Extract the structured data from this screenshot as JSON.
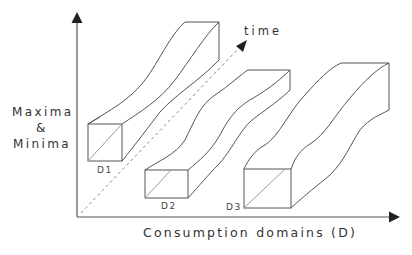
{
  "diagram": {
    "y_axis": {
      "label_line1": "Maxima",
      "label_line2": "&",
      "label_line3": "Minima"
    },
    "x_axis": {
      "label": "Consumption domains (D)"
    },
    "time_axis": {
      "label": "time"
    },
    "domains": [
      {
        "id": "D1",
        "label": "D1"
      },
      {
        "id": "D2",
        "label": "D2"
      },
      {
        "id": "D3",
        "label": "D3"
      }
    ],
    "colors": {
      "line": "#555555",
      "axis": "#444444",
      "arrow": "#222222",
      "dashed": "#888888"
    }
  }
}
